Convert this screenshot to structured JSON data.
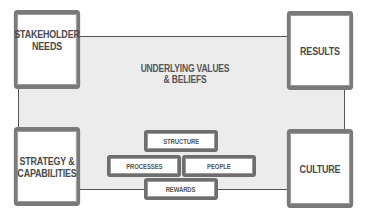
{
  "diagram": {
    "corners": {
      "top_left": [
        "STAKEHOLDER",
        "NEEDS"
      ],
      "top_right": [
        "RESULTS"
      ],
      "bottom_left": [
        "STRATEGY &",
        "CAPABILITIES"
      ],
      "bottom_right": [
        "CULTURE"
      ]
    },
    "center": [
      "UNDERLYING VALUES",
      "& BELIEFS"
    ],
    "components": {
      "structure": "STRUCTURE",
      "processes": "PROCESSES",
      "people": "PEOPLE",
      "rewards": "REWARDS"
    },
    "colors": {
      "border": "#7a7a7a",
      "frame_fill": "#ececec",
      "text": "#4a4a4a"
    }
  }
}
